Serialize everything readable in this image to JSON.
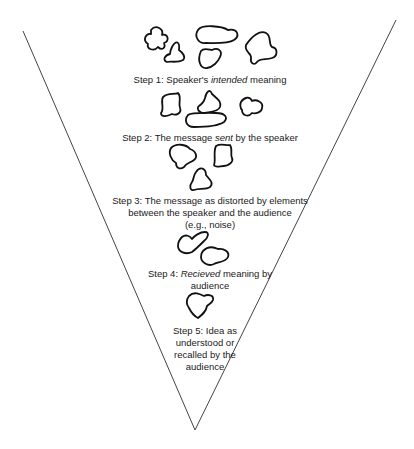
{
  "diagram": {
    "type": "funnel",
    "title": "",
    "steps": [
      {
        "label_parts": [
          {
            "text": "Step 1:  Speaker's ",
            "italic": false
          },
          {
            "text": "intended",
            "italic": true
          },
          {
            "text": " meaning",
            "italic": false
          }
        ],
        "shape_count": 5
      },
      {
        "label_parts": [
          {
            "text": "Step 2:  The message ",
            "italic": false
          },
          {
            "text": "sent",
            "italic": true
          },
          {
            "text": " by the speaker",
            "italic": false
          }
        ],
        "shape_count": 4
      },
      {
        "lines": [
          "Step 3:  The message as distorted by elements",
          "between the speaker and the audience",
          "(e.g., noise)"
        ],
        "shape_count": 3
      },
      {
        "label_parts": [
          {
            "text": "Step 4:  ",
            "italic": false
          },
          {
            "text": "Recieved",
            "italic": true
          },
          {
            "text": " meaning by",
            "italic": false
          }
        ],
        "line2": "audience",
        "shape_count": 2
      },
      {
        "lines": [
          "Step 5:  Idea as",
          "understood or",
          "recalled by the",
          "audience"
        ],
        "shape_count": 1
      }
    ]
  }
}
